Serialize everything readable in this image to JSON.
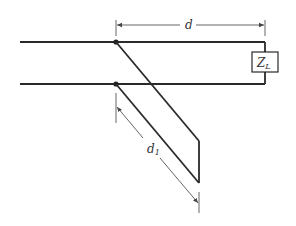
{
  "diagram": {
    "labels": {
      "distance_to_load": "d",
      "stub_length": "d",
      "stub_length_sub": "1",
      "load": "Z",
      "load_sub": "L"
    },
    "colors": {
      "line": "#2a2a2a",
      "dimension": "#444444",
      "background": "#ffffff"
    },
    "elements": [
      {
        "id": "top-conductor",
        "type": "line"
      },
      {
        "id": "bottom-conductor",
        "type": "line"
      },
      {
        "id": "load-impedance",
        "type": "box",
        "label": "Z_L"
      },
      {
        "id": "stub",
        "type": "parallel-wire stub"
      },
      {
        "id": "dimension-d",
        "type": "dimension"
      },
      {
        "id": "dimension-d1",
        "type": "dimension"
      }
    ]
  }
}
